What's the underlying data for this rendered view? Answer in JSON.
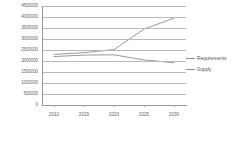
{
  "chart_data": {
    "type": "line",
    "title": "",
    "xlabel": "",
    "ylabel": "",
    "x": [
      2010,
      2015,
      2020,
      2025,
      2030
    ],
    "categories": [
      "2010",
      "2015",
      "2020",
      "2025",
      "2030"
    ],
    "xlim": [
      2008,
      2032
    ],
    "ylim": [
      0,
      4500000
    ],
    "ytick_labels": [
      "4500000",
      "4000000",
      "3500000",
      "3000000",
      "2500000",
      "2000000",
      "1500000",
      "1000000",
      "500000",
      "0"
    ],
    "ytick_values": [
      4500000,
      4000000,
      3500000,
      3000000,
      2500000,
      2000000,
      1500000,
      1000000,
      500000,
      0
    ],
    "grid": true,
    "legend_position": "right",
    "series": [
      {
        "name": "Requirements",
        "color": "#8d8d8d",
        "values": [
          2300000,
          2380000,
          2520000,
          3450000,
          3950000
        ]
      },
      {
        "name": "Supply",
        "color": "#8d8d8d",
        "values": [
          2200000,
          2270000,
          2280000,
          2050000,
          1920000
        ]
      }
    ]
  }
}
